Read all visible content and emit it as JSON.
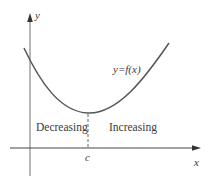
{
  "diagram": {
    "axes": {
      "x_label": "x",
      "y_label": "y"
    },
    "curve": {
      "label": "y=f(x)",
      "color": "#555555"
    },
    "critical_point": {
      "label": "c"
    },
    "regions": {
      "left": "Decreasing",
      "right": "Increasing"
    },
    "colors": {
      "axis": "#444444",
      "y_axis": "#9a9a9a",
      "dashed": "#666666",
      "text": "#3a3a3a"
    }
  }
}
